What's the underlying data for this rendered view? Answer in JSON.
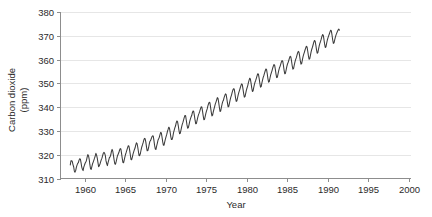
{
  "chart_data": {
    "type": "line",
    "title": "",
    "xlabel": "Year",
    "ylabel": "Carbon dioxide (ppm)",
    "ylabel_line1": "Carbon dioxide",
    "ylabel_line2": "(ppm)",
    "xlim": [
      1957.0,
      2000.3
    ],
    "ylim": [
      310,
      380
    ],
    "xticks": [
      1960,
      1965,
      1970,
      1975,
      1980,
      1985,
      1990,
      1995,
      2000
    ],
    "xtick_labels": [
      "1960",
      "1965",
      "1970",
      "1975",
      "1980",
      "1985",
      "1990",
      "1995",
      "2000"
    ],
    "yticks": [
      310,
      320,
      330,
      340,
      350,
      360,
      370,
      380
    ],
    "ytick_labels": [
      "310",
      "320",
      "330",
      "340",
      "350",
      "360",
      "370",
      "380"
    ],
    "grid": "horizontal",
    "legend": "none",
    "line_color": "#3c3c3c",
    "grid_color": "#e6e6e6",
    "axis_color": "#8d8d8d",
    "background_color": "#ffffff",
    "series": [
      {
        "name": "Atmospheric CO2 (Mauna Loa monthly mean)",
        "x_start": 1958.208,
        "x_step": 0.0833333,
        "values": [
          315.71,
          317.45,
          317.5,
          317.1,
          315.86,
          314.93,
          313.2,
          312.66,
          313.33,
          314.67,
          315.62,
          316.38,
          316.71,
          317.72,
          318.29,
          318.15,
          316.54,
          314.8,
          313.84,
          313.33,
          314.81,
          315.58,
          316.43,
          316.97,
          317.58,
          319.02,
          320.03,
          319.59,
          318.18,
          315.91,
          314.16,
          313.83,
          315.0,
          316.19,
          316.89,
          317.7,
          318.54,
          319.48,
          320.58,
          319.78,
          318.58,
          316.79,
          314.99,
          315.31,
          316.1,
          317.01,
          317.94,
          318.56,
          319.68,
          320.63,
          321.01,
          320.55,
          319.58,
          317.4,
          316.26,
          315.42,
          316.69,
          317.69,
          318.74,
          319.08,
          319.86,
          321.39,
          322.24,
          321.47,
          319.74,
          317.77,
          316.21,
          315.99,
          317.07,
          318.36,
          319.57,
          320.23,
          320.91,
          321.88,
          322.57,
          322.39,
          320.58,
          318.55,
          316.8,
          316.6,
          317.79,
          319.07,
          320.2,
          321.07,
          322.04,
          322.98,
          323.79,
          323.57,
          321.95,
          320.0,
          318.0,
          317.89,
          319.01,
          320.28,
          321.2,
          322.11,
          322.82,
          324.05,
          325.01,
          324.66,
          323.24,
          321.36,
          319.6,
          319.7,
          320.61,
          322.08,
          323.25,
          324.12,
          325.06,
          326.17,
          326.87,
          326.72,
          325.31,
          323.3,
          321.63,
          321.76,
          322.83,
          324.33,
          325.57,
          325.95,
          326.72,
          327.53,
          327.92,
          327.83,
          326.05,
          323.92,
          322.45,
          322.19,
          323.57,
          324.8,
          326.06,
          326.69,
          327.37,
          328.47,
          329.39,
          329.18,
          327.42,
          325.48,
          323.97,
          324.01,
          325.38,
          326.56,
          327.57,
          328.54,
          329.75,
          330.62,
          331.57,
          331.2,
          329.57,
          327.63,
          326.39,
          326.44,
          327.52,
          329.18,
          330.22,
          331.28,
          332.06,
          333.36,
          334.19,
          333.93,
          332.37,
          330.46,
          328.81,
          328.96,
          330.21,
          331.61,
          332.77,
          333.57,
          334.69,
          335.69,
          336.52,
          336.35,
          334.48,
          332.52,
          331.14,
          331.36,
          332.57,
          333.94,
          334.95,
          335.84,
          336.45,
          337.66,
          338.4,
          338.16,
          336.44,
          334.5,
          332.98,
          333.14,
          334.4,
          335.73,
          336.75,
          337.47,
          338.28,
          339.29,
          340.12,
          340.09,
          338.45,
          336.42,
          334.71,
          334.8,
          336.14,
          337.39,
          338.4,
          339.27,
          340.54,
          341.44,
          342.02,
          341.87,
          339.93,
          337.93,
          336.31,
          336.61,
          338.03,
          339.16,
          340.23,
          341.35,
          342.13,
          343.09,
          344.0,
          343.69,
          342.03,
          339.97,
          338.15,
          338.44,
          339.9,
          341.22,
          342.32,
          342.87,
          344.0,
          344.86,
          345.57,
          345.34,
          343.68,
          341.76,
          340.1,
          340.35,
          341.73,
          343.04,
          344.22,
          345.07,
          346.16,
          347.18,
          347.72,
          347.6,
          345.87,
          343.92,
          342.39,
          342.61,
          343.95,
          345.3,
          346.31,
          347.17,
          348.16,
          349.08,
          349.78,
          349.45,
          347.69,
          345.76,
          344.18,
          344.42,
          345.66,
          347.01,
          348.05,
          348.98,
          350.2,
          351.26,
          352.17,
          351.81,
          350.1,
          348.12,
          346.58,
          346.84,
          348.29,
          349.59,
          350.59,
          351.34,
          352.29,
          353.29,
          354.05,
          353.75,
          352.09,
          350.09,
          348.42,
          348.61,
          350.12,
          351.35,
          352.54,
          353.32,
          354.34,
          355.29,
          356.05,
          355.78,
          354.05,
          352.0,
          350.5,
          350.74,
          352.15,
          353.42,
          354.43,
          355.28,
          356.36,
          357.26,
          357.95,
          357.58,
          355.88,
          353.91,
          352.42,
          352.58,
          354.0,
          355.37,
          356.44,
          357.15,
          358.12,
          359.02,
          359.56,
          359.23,
          357.52,
          355.48,
          354.0,
          354.25,
          355.67,
          357.0,
          358.14,
          358.84,
          359.72,
          360.68,
          361.39,
          361.09,
          359.41,
          357.41,
          355.95,
          356.18,
          357.61,
          358.9,
          359.95,
          360.71,
          361.73,
          362.82,
          363.43,
          363.13,
          361.52,
          359.54,
          358.08,
          358.29,
          359.76,
          361.13,
          362.19,
          363.05,
          364.03,
          364.84,
          365.58,
          365.35,
          363.62,
          361.63,
          360.14,
          360.37,
          361.79,
          363.23,
          364.34,
          365.18,
          366.23,
          367.3,
          368.02,
          367.79,
          366.14,
          364.19,
          362.65,
          362.89,
          364.35,
          365.71,
          366.79,
          367.61,
          368.57,
          369.71,
          370.51,
          370.24,
          368.56,
          366.58,
          365.07,
          365.33,
          366.77,
          368.12,
          369.15,
          369.94,
          370.76,
          371.62,
          372.35,
          372.04,
          370.35,
          368.33,
          366.8,
          367.0,
          368.3,
          369.42,
          370.4,
          371.1,
          371.8,
          372.4,
          372.8,
          372.4
        ]
      }
    ]
  }
}
